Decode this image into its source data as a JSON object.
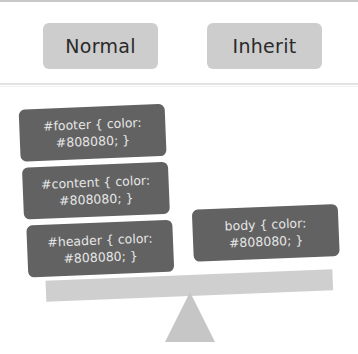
{
  "buttons": {
    "normal_label": "Normal",
    "inherit_label": "Inherit"
  },
  "seesaw": {
    "left_boxes": [
      {
        "line1": "#footer { color:",
        "line2": "#808080; }"
      },
      {
        "line1": "#content { color:",
        "line2": "#808080; }"
      },
      {
        "line1": "#header { color:",
        "line2": "#808080; }"
      }
    ],
    "right_box": {
      "line1": "body { color:",
      "line2": "#808080; }"
    }
  },
  "colors": {
    "button_bg": "#cdcdcd",
    "box_bg": "#626262",
    "box_text": "#e6e6e6",
    "plank": "#cfcfcf",
    "fulcrum": "#c6c6c6"
  }
}
